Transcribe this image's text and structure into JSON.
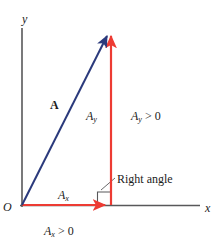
{
  "figure": {
    "width": 221,
    "height": 248,
    "background": "#ffffff"
  },
  "colors": {
    "axis": "#58585a",
    "vector": "#2b3a7c",
    "component": "#ed3b33",
    "text": "#1b1b1b",
    "leader": "#58585a"
  },
  "axes": {
    "x_label": "x",
    "y_label": "y",
    "origin_label": "O"
  },
  "labels": {
    "vector_a": "A",
    "ax": "A",
    "ax_sub": "x",
    "ay": "A",
    "ay_sub": "y",
    "ax_positive": "A",
    "ax_positive_sub": "x",
    "ax_positive_rel": " > 0",
    "ay_positive": "A",
    "ay_positive_sub": "y",
    "ay_positive_rel": " > 0",
    "right_angle": "Right angle"
  },
  "geometry": {
    "origin": [
      22,
      205
    ],
    "tip": [
      111,
      30
    ],
    "x_axis_end": [
      200,
      205
    ],
    "y_axis_top": [
      22,
      28
    ],
    "ax_component_end": [
      111,
      205
    ],
    "ay_component_top": [
      111,
      30
    ],
    "right_angle_marker_size": 13
  }
}
